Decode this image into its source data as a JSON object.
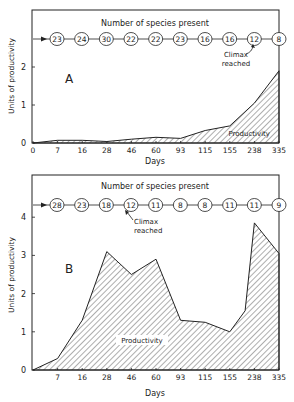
{
  "chart_data": [
    {
      "type": "area",
      "panel_label": "A",
      "title": "Number of species present",
      "xlabel": "Days",
      "ylabel": "Units of productivity",
      "categories": [
        "0",
        "7",
        "16",
        "28",
        "46",
        "60",
        "93",
        "115",
        "155",
        "238",
        "335"
      ],
      "series": [
        {
          "name": "Productivity",
          "values": [
            0,
            0.07,
            0.07,
            0.04,
            0.1,
            0.15,
            0.12,
            0.33,
            0.45,
            1.05,
            1.9
          ]
        }
      ],
      "species_present": [
        23,
        24,
        30,
        22,
        22,
        23,
        16,
        16,
        12,
        8
      ],
      "annotations": [
        {
          "text": "Climax reached",
          "points_to_species_index": 8
        },
        {
          "text": "Productivity"
        }
      ],
      "yticks": [
        "0",
        "1",
        "2"
      ],
      "ylim": [
        0,
        3.5
      ],
      "grid": false,
      "legend": "none"
    },
    {
      "type": "area",
      "panel_label": "B",
      "title": "Number of species present",
      "xlabel": "Days",
      "ylabel": "Units of productivity",
      "categories": [
        "0",
        "7",
        "16",
        "28",
        "46",
        "60",
        "93",
        "115",
        "155",
        "238",
        "335"
      ],
      "series": [
        {
          "name": "Productivity",
          "values": [
            0,
            0.3,
            1.3,
            3.1,
            2.5,
            2.9,
            1.3,
            1.25,
            1.0,
            3.85,
            3.05
          ]
        }
      ],
      "extra_point_between_155_and_238": 1.55,
      "species_present": [
        28,
        23,
        18,
        12,
        11,
        8,
        8,
        11,
        11,
        9
      ],
      "annotations": [
        {
          "text": "Climax reached",
          "points_to_species_index": 3
        },
        {
          "text": "Productivity"
        }
      ],
      "yticks": [
        "0",
        "1",
        "2",
        "3",
        "4"
      ],
      "ylim": [
        0,
        5
      ],
      "grid": false,
      "legend": "none"
    }
  ],
  "labels": {
    "species_title": "Number of species present",
    "climax_line1": "Climax",
    "climax_line2": "reached",
    "productivity": "Productivity",
    "days": "Days",
    "ylabel": "Units of productivity",
    "panel_a": "A",
    "panel_b": "B"
  }
}
